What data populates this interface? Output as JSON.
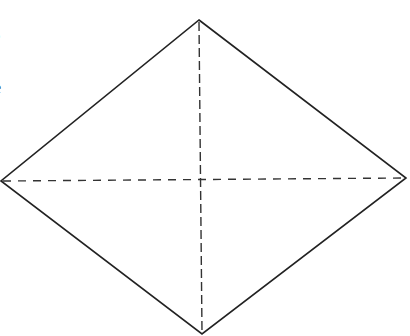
{
  "edge_text": {
    "line1": "s",
    "line2": ".",
    "line3": "e"
  },
  "figure": {
    "type": "rhombus-with-diagonals",
    "stroke_color": "#222222",
    "dash_color": "#333333",
    "vertices": {
      "top": [
        199,
        20
      ],
      "right": [
        406,
        178
      ],
      "bottom": [
        202,
        334
      ],
      "left": [
        1,
        181
      ]
    },
    "center": [
      200,
      179
    ]
  }
}
